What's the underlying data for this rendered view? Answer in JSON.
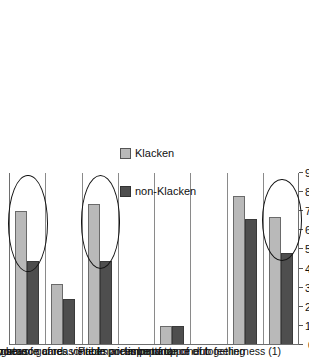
{
  "figure": {
    "orientation": "rotated-90",
    "background": "#ffffff"
  },
  "legend": {
    "position": "right",
    "items": [
      {
        "label": "Klacken",
        "color": "#b9b9b9",
        "swatch": "light-gray-swatch"
      },
      {
        "label": "non-Klacken",
        "color": "#4e4e4e",
        "swatch": "dark-gray-swatch"
      }
    ]
  },
  "axis": {
    "ticks": [
      0,
      10,
      20,
      30,
      40,
      50,
      60,
      70,
      80,
      90
    ],
    "min": 0,
    "max": 90
  },
  "annotations": [
    {
      "name": "highlight-ellipse-knowledge",
      "target": "Knowledge of the game"
    },
    {
      "name": "highlight-ellipse-games-visited",
      "target": "Number of games visited"
    },
    {
      "name": "highlight-ellipse-togetherness",
      "target": "Importance of togetherness (1)"
    }
  ],
  "chart_data": {
    "type": "bar",
    "orientation": "horizontal",
    "title": "",
    "xlabel": "",
    "ylabel": "",
    "xlim": [
      0,
      90
    ],
    "grid": false,
    "legend_position": "right",
    "categories": [
      "Knowledge of the game",
      "Would buy season card",
      "Number of games visited",
      "Importance of reasonable prices",
      "Prices are important",
      "Importance of opponent",
      "Importance of club feeling",
      "Importance of togetherness (1)"
    ],
    "series": [
      {
        "name": "Klacken",
        "color": "#b9b9b9",
        "values": [
          70,
          32,
          74,
          0,
          10,
          0,
          78,
          67
        ]
      },
      {
        "name": "non-Klacken",
        "color": "#4e4e4e",
        "values": [
          44,
          24,
          44,
          0,
          10,
          0,
          66,
          48
        ]
      }
    ]
  }
}
